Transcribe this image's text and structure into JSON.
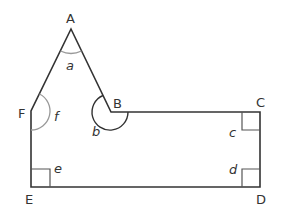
{
  "diagram": {
    "type": "polygon",
    "title": "",
    "colors": {
      "outline": "#333333",
      "angle_arc": "#999999",
      "right_angle": "#555555",
      "label": "#333333"
    },
    "vertices": [
      {
        "name": "A",
        "label": "A",
        "x": 71,
        "y": 29
      },
      {
        "name": "B",
        "label": "B",
        "x": 111,
        "y": 112
      },
      {
        "name": "C",
        "label": "C",
        "x": 260,
        "y": 112
      },
      {
        "name": "D",
        "label": "D",
        "x": 260,
        "y": 187
      },
      {
        "name": "E",
        "label": "E",
        "x": 31,
        "y": 187
      },
      {
        "name": "F",
        "label": "F",
        "x": 31,
        "y": 111
      }
    ],
    "angles": [
      {
        "vertex": "A",
        "label": "a",
        "marker": "arc"
      },
      {
        "vertex": "B",
        "label": "b",
        "marker": "reflex-arc"
      },
      {
        "vertex": "C",
        "label": "c",
        "marker": "right-angle"
      },
      {
        "vertex": "D",
        "label": "d",
        "marker": "right-angle"
      },
      {
        "vertex": "E",
        "label": "e",
        "marker": "right-angle"
      },
      {
        "vertex": "F",
        "label": "f",
        "marker": "arc"
      }
    ]
  }
}
